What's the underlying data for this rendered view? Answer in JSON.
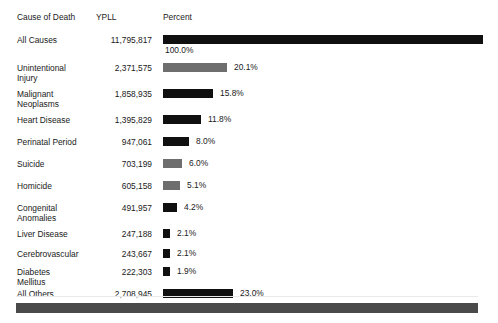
{
  "header": {
    "cause_label": "Cause\nof Death",
    "ypll_label": "YPLL",
    "percent_label": "Percent"
  },
  "colors": {
    "bar_dark": "#101010",
    "bar_gray": "#6e6e6e",
    "footer": "#4a4a4a",
    "text": "#1a1a1a"
  },
  "chart_data": {
    "type": "bar",
    "title": "",
    "xlabel": "Percent",
    "ylabel": "Cause of Death",
    "orientation": "horizontal",
    "grid": false,
    "legend": "none",
    "xlim": [
      0,
      100
    ],
    "value_unit": "YPLL",
    "categories": [
      "All Causes",
      "Unintentional\nInjury",
      "Malignant\nNeoplasms",
      "Heart Disease",
      "Perinatal Period",
      "Suicide",
      "Homicide",
      "Congenital\nAnomalies",
      "Liver Disease",
      "Cerebrovascular",
      "Diabetes\nMellitus",
      "All Others"
    ],
    "values": [
      11795817,
      2371575,
      1858935,
      1395829,
      947061,
      703199,
      605158,
      491957,
      247188,
      243667,
      222303,
      2708945
    ],
    "percents": [
      100.0,
      20.1,
      15.8,
      11.8,
      8.0,
      6.0,
      5.1,
      4.2,
      2.1,
      2.1,
      1.9,
      23.0
    ],
    "rows": [
      {
        "cause": "All Causes",
        "ypll": "11,795,817",
        "percent_label": "100.0%",
        "percent": 100.0,
        "bar_px": 320,
        "color": "dark",
        "pct_below": true
      },
      {
        "cause": "Unintentional\nInjury",
        "ypll": "2,371,575",
        "percent_label": "20.1%",
        "percent": 20.1,
        "bar_px": 64,
        "color": "gray",
        "pct_below": false
      },
      {
        "cause": "Malignant\nNeoplasms",
        "ypll": "1,858,935",
        "percent_label": "15.8%",
        "percent": 15.8,
        "bar_px": 50,
        "color": "dark",
        "pct_below": false
      },
      {
        "cause": "Heart Disease",
        "ypll": "1,395,829",
        "percent_label": "11.8%",
        "percent": 11.8,
        "bar_px": 38,
        "color": "dark",
        "pct_below": false
      },
      {
        "cause": "Perinatal Period",
        "ypll": "947,061",
        "percent_label": "8.0%",
        "percent": 8.0,
        "bar_px": 26,
        "color": "dark",
        "pct_below": false
      },
      {
        "cause": "Suicide",
        "ypll": "703,199",
        "percent_label": "6.0%",
        "percent": 6.0,
        "bar_px": 19,
        "color": "gray",
        "pct_below": false
      },
      {
        "cause": "Homicide",
        "ypll": "605,158",
        "percent_label": "5.1%",
        "percent": 5.1,
        "bar_px": 17,
        "color": "gray",
        "pct_below": false
      },
      {
        "cause": "Congenital\nAnomalies",
        "ypll": "491,957",
        "percent_label": "4.2%",
        "percent": 4.2,
        "bar_px": 14,
        "color": "dark",
        "pct_below": false
      },
      {
        "cause": "Liver Disease",
        "ypll": "247,188",
        "percent_label": "2.1%",
        "percent": 2.1,
        "bar_px": 7,
        "color": "dark",
        "pct_below": false
      },
      {
        "cause": "Cerebrovascular",
        "ypll": "243,667",
        "percent_label": "2.1%",
        "percent": 2.1,
        "bar_px": 7,
        "color": "dark",
        "pct_below": false
      },
      {
        "cause": "Diabetes\nMellitus",
        "ypll": "222,303",
        "percent_label": "1.9%",
        "percent": 1.9,
        "bar_px": 7,
        "color": "dark",
        "pct_below": false
      },
      {
        "cause": "All Others",
        "ypll": "2,708,945",
        "percent_label": "23.0%",
        "percent": 23.0,
        "bar_px": 70,
        "color": "dark",
        "pct_below": false
      }
    ]
  }
}
